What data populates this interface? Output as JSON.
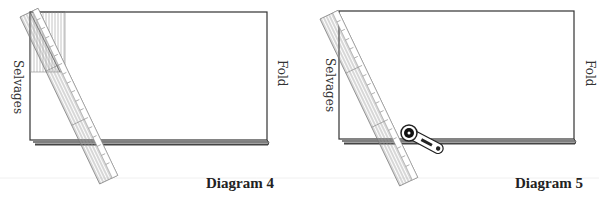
{
  "diagrams": [
    {
      "id": "diagram-4",
      "caption": "Diagram 4",
      "left_label": "Selvages",
      "right_label": "Fold",
      "tools": [
        "long-ruler",
        "square-ruler"
      ],
      "fabric_rect": {
        "x": 30,
        "y": 12,
        "w": 237,
        "h": 128
      }
    },
    {
      "id": "diagram-5",
      "caption": "Diagram 5",
      "left_label": "Selvages",
      "right_label": "Fold",
      "tools": [
        "long-ruler",
        "rotary-cutter"
      ],
      "fabric_rect": {
        "x": 339,
        "y": 11,
        "w": 235,
        "h": 128
      }
    }
  ],
  "colors": {
    "outline": "#333333",
    "hatch": "#999999",
    "fold_edge": "#555555"
  }
}
